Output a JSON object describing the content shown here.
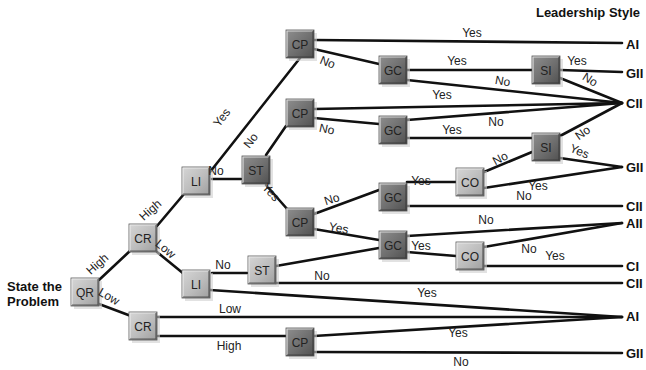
{
  "title": "Leadership Style",
  "start_label": [
    "State the",
    "Problem"
  ],
  "colors": {
    "line": "#111111",
    "node_light": "#bdbdbd",
    "node_dark": "#7a7a7a",
    "text": "#222222"
  },
  "nodes": [
    {
      "id": "qr",
      "label": "QR",
      "x": 85,
      "y": 292,
      "shade": "light"
    },
    {
      "id": "cr1",
      "label": "CR",
      "x": 143,
      "y": 238,
      "shade": "light"
    },
    {
      "id": "cr2",
      "label": "CR",
      "x": 143,
      "y": 326,
      "shade": "light"
    },
    {
      "id": "li1",
      "label": "LI",
      "x": 196,
      "y": 181,
      "shade": "light"
    },
    {
      "id": "li2",
      "label": "LI",
      "x": 196,
      "y": 284,
      "shade": "light"
    },
    {
      "id": "st1",
      "label": "ST",
      "x": 256,
      "y": 170,
      "shade": "dark"
    },
    {
      "id": "st2",
      "label": "ST",
      "x": 262,
      "y": 270,
      "shade": "light"
    },
    {
      "id": "cp1",
      "label": "CP",
      "x": 300,
      "y": 44,
      "shade": "dark"
    },
    {
      "id": "cp2",
      "label": "CP",
      "x": 300,
      "y": 113,
      "shade": "dark"
    },
    {
      "id": "cp3",
      "label": "CP",
      "x": 300,
      "y": 222,
      "shade": "dark"
    },
    {
      "id": "cp4",
      "label": "CP",
      "x": 300,
      "y": 342,
      "shade": "dark"
    },
    {
      "id": "gc1",
      "label": "GC",
      "x": 393,
      "y": 70,
      "shade": "dark"
    },
    {
      "id": "gc2",
      "label": "GC",
      "x": 393,
      "y": 130,
      "shade": "dark"
    },
    {
      "id": "gc3",
      "label": "GC",
      "x": 393,
      "y": 197,
      "shade": "dark"
    },
    {
      "id": "gc4",
      "label": "GC",
      "x": 393,
      "y": 245,
      "shade": "dark"
    },
    {
      "id": "si1",
      "label": "SI",
      "x": 546,
      "y": 70,
      "shade": "dark"
    },
    {
      "id": "si2",
      "label": "SI",
      "x": 546,
      "y": 147,
      "shade": "dark"
    },
    {
      "id": "co1",
      "label": "CO",
      "x": 470,
      "y": 182,
      "shade": "light"
    },
    {
      "id": "co2",
      "label": "CO",
      "x": 470,
      "y": 256,
      "shade": "light"
    }
  ],
  "outcomes": [
    {
      "label": "AI",
      "x": 626,
      "y": 44
    },
    {
      "label": "GII",
      "x": 626,
      "y": 73
    },
    {
      "label": "CII",
      "x": 626,
      "y": 103
    },
    {
      "label": "GII",
      "x": 626,
      "y": 167
    },
    {
      "label": "CII",
      "x": 626,
      "y": 206
    },
    {
      "label": "AII",
      "x": 626,
      "y": 223
    },
    {
      "label": "CI",
      "x": 626,
      "y": 266
    },
    {
      "label": "CII",
      "x": 626,
      "y": 283
    },
    {
      "label": "AI",
      "x": 626,
      "y": 316
    },
    {
      "label": "GII",
      "x": 626,
      "y": 353
    }
  ],
  "edges": [
    {
      "d": "M99,280 L131,250"
    },
    {
      "d": "M99,304 L131,316"
    },
    {
      "d": "M157,226 L184,194"
    },
    {
      "d": "M157,252 L184,274"
    },
    {
      "d": "M210,172 L300,58"
    },
    {
      "d": "M212,179 L241,179"
    },
    {
      "d": "M266,155 L286,126"
    },
    {
      "d": "M266,185 L288,210"
    },
    {
      "d": "M212,273 L247,273"
    },
    {
      "d": "M158,317 L622,317"
    },
    {
      "d": "M158,336 L286,336"
    },
    {
      "d": "M314,40 L622,43"
    },
    {
      "d": "M314,49 L379,64"
    },
    {
      "d": "M407,70 L532,70"
    },
    {
      "d": "M560,70 L622,72"
    },
    {
      "d": "M407,80 L622,103"
    },
    {
      "d": "M560,78 L622,103"
    },
    {
      "d": "M314,109 L622,103"
    },
    {
      "d": "M314,118 L379,124"
    },
    {
      "d": "M407,120 L622,103"
    },
    {
      "d": "M407,138 L532,138"
    },
    {
      "d": "M560,136 L622,103"
    },
    {
      "d": "M560,158 L622,167"
    },
    {
      "d": "M484,172 L532,152"
    },
    {
      "d": "M484,188 L622,167"
    },
    {
      "d": "M314,214 L379,190"
    },
    {
      "d": "M407,182 L456,182"
    },
    {
      "d": "M407,206 L622,206"
    },
    {
      "d": "M314,229 L379,240"
    },
    {
      "d": "M407,236 L622,223"
    },
    {
      "d": "M407,252 L456,256"
    },
    {
      "d": "M484,247 L622,223"
    },
    {
      "d": "M484,266 L622,266"
    },
    {
      "d": "M276,266 L379,248"
    },
    {
      "d": "M276,283 L622,283"
    },
    {
      "d": "M210,290 L622,317"
    },
    {
      "d": "M314,336 L622,317"
    },
    {
      "d": "M314,352 L622,353"
    }
  ],
  "edge_labels": [
    {
      "text": "High",
      "x": 100,
      "y": 267,
      "rot": -42
    },
    {
      "text": "Low",
      "x": 107,
      "y": 300,
      "rot": 30
    },
    {
      "text": "High",
      "x": 153,
      "y": 213,
      "rot": -42
    },
    {
      "text": "Low",
      "x": 163,
      "y": 252,
      "rot": 40
    },
    {
      "text": "Yes",
      "x": 225,
      "y": 120,
      "rot": -52
    },
    {
      "text": "No",
      "x": 216,
      "y": 175,
      "rot": 0
    },
    {
      "text": "No",
      "x": 254,
      "y": 143,
      "rot": -52
    },
    {
      "text": "Yes",
      "x": 268,
      "y": 195,
      "rot": 48
    },
    {
      "text": "No",
      "x": 223,
      "y": 269,
      "rot": 0
    },
    {
      "text": "Low",
      "x": 230,
      "y": 313,
      "rot": 0
    },
    {
      "text": "High",
      "x": 229,
      "y": 350,
      "rot": 0
    },
    {
      "text": "Yes",
      "x": 472,
      "y": 37,
      "rot": 0
    },
    {
      "text": "No",
      "x": 326,
      "y": 66,
      "rot": 22
    },
    {
      "text": "Yes",
      "x": 457,
      "y": 65,
      "rot": 0
    },
    {
      "text": "Yes",
      "x": 577,
      "y": 65,
      "rot": 0
    },
    {
      "text": "No",
      "x": 502,
      "y": 85,
      "rot": 10
    },
    {
      "text": "No",
      "x": 588,
      "y": 83,
      "rot": 32
    },
    {
      "text": "Yes",
      "x": 442,
      "y": 99,
      "rot": 0
    },
    {
      "text": "No",
      "x": 326,
      "y": 133,
      "rot": 12
    },
    {
      "text": "No",
      "x": 496,
      "y": 126,
      "rot": 0
    },
    {
      "text": "Yes",
      "x": 452,
      "y": 134,
      "rot": 0
    },
    {
      "text": "No",
      "x": 585,
      "y": 136,
      "rot": -35
    },
    {
      "text": "No",
      "x": 502,
      "y": 162,
      "rot": -28
    },
    {
      "text": "Yes",
      "x": 578,
      "y": 155,
      "rot": 22
    },
    {
      "text": "Yes",
      "x": 538,
      "y": 190,
      "rot": 0
    },
    {
      "text": "No",
      "x": 524,
      "y": 200,
      "rot": 0
    },
    {
      "text": "No",
      "x": 333,
      "y": 203,
      "rot": -18
    },
    {
      "text": "Yes",
      "x": 421,
      "y": 185,
      "rot": 0
    },
    {
      "text": "Yes",
      "x": 338,
      "y": 232,
      "rot": 10
    },
    {
      "text": "No",
      "x": 486,
      "y": 224,
      "rot": 0
    },
    {
      "text": "Yes",
      "x": 421,
      "y": 250,
      "rot": 0
    },
    {
      "text": "No",
      "x": 529,
      "y": 253,
      "rot": 0
    },
    {
      "text": "Yes",
      "x": 555,
      "y": 260,
      "rot": 0
    },
    {
      "text": "No",
      "x": 322,
      "y": 280,
      "rot": 0
    },
    {
      "text": "Yes",
      "x": 427,
      "y": 297,
      "rot": 0
    },
    {
      "text": "Yes",
      "x": 458,
      "y": 337,
      "rot": 0
    },
    {
      "text": "No",
      "x": 461,
      "y": 366,
      "rot": 0
    }
  ]
}
